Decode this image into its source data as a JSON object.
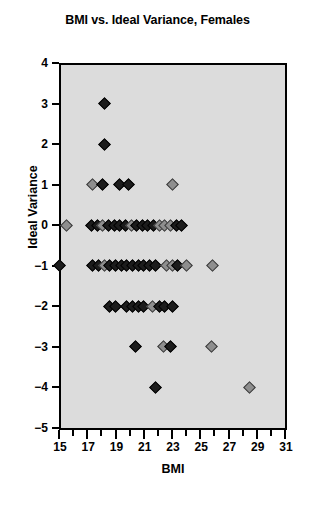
{
  "chart_data": {
    "type": "scatter",
    "title": "BMI vs. Ideal Variance, Females",
    "xlabel": "BMI",
    "ylabel": "Ideal Variance",
    "xlim": [
      15,
      31
    ],
    "ylim": [
      -5,
      4
    ],
    "xticks": [
      15,
      16,
      17,
      18,
      19,
      20,
      21,
      22,
      23,
      24,
      25,
      26,
      27,
      28,
      29,
      30,
      31
    ],
    "xtick_labels": [
      "15",
      "",
      "17",
      "",
      "19",
      "",
      "21",
      "",
      "23",
      "",
      "25",
      "",
      "27",
      "",
      "29",
      "",
      "31"
    ],
    "yticks": [
      4,
      3,
      2,
      1,
      0,
      -1,
      -2,
      -3,
      -4,
      -5
    ],
    "ytick_labels": [
      "4",
      "3",
      "2",
      "1",
      "0",
      "−1",
      "−2",
      "−3",
      "−4",
      "−5"
    ],
    "grid": false,
    "legend": false,
    "plot_bgcolor": "#dcdcdc",
    "marker_colors": {
      "dark": "#1c1c1c",
      "light": "#8e8e8e"
    },
    "points": [
      {
        "x": 18.25,
        "y": 3,
        "shade": "dark"
      },
      {
        "x": 18.25,
        "y": 2,
        "shade": "dark"
      },
      {
        "x": 17.4,
        "y": 1,
        "shade": "light"
      },
      {
        "x": 18.1,
        "y": 1,
        "shade": "dark"
      },
      {
        "x": 19.3,
        "y": 1,
        "shade": "dark"
      },
      {
        "x": 19.9,
        "y": 1,
        "shade": "dark"
      },
      {
        "x": 23.0,
        "y": 1,
        "shade": "light"
      },
      {
        "x": 15.5,
        "y": 0,
        "shade": "light"
      },
      {
        "x": 17.3,
        "y": 0,
        "shade": "dark"
      },
      {
        "x": 17.7,
        "y": 0,
        "shade": "dark"
      },
      {
        "x": 18.1,
        "y": 0,
        "shade": "light"
      },
      {
        "x": 18.5,
        "y": 0,
        "shade": "dark"
      },
      {
        "x": 18.9,
        "y": 0,
        "shade": "dark"
      },
      {
        "x": 19.3,
        "y": 0,
        "shade": "dark"
      },
      {
        "x": 19.7,
        "y": 0,
        "shade": "dark"
      },
      {
        "x": 20.1,
        "y": 0,
        "shade": "light"
      },
      {
        "x": 20.5,
        "y": 0,
        "shade": "dark"
      },
      {
        "x": 20.9,
        "y": 0,
        "shade": "dark"
      },
      {
        "x": 21.3,
        "y": 0,
        "shade": "dark"
      },
      {
        "x": 21.7,
        "y": 0,
        "shade": "dark"
      },
      {
        "x": 22.1,
        "y": 0,
        "shade": "light"
      },
      {
        "x": 22.5,
        "y": 0,
        "shade": "light"
      },
      {
        "x": 22.9,
        "y": 0,
        "shade": "light"
      },
      {
        "x": 23.3,
        "y": 0,
        "shade": "dark"
      },
      {
        "x": 23.7,
        "y": 0,
        "shade": "dark"
      },
      {
        "x": 15.0,
        "y": -1,
        "shade": "dark"
      },
      {
        "x": 17.4,
        "y": -1,
        "shade": "dark"
      },
      {
        "x": 17.8,
        "y": -1,
        "shade": "dark"
      },
      {
        "x": 18.2,
        "y": -1,
        "shade": "light"
      },
      {
        "x": 18.6,
        "y": -1,
        "shade": "dark"
      },
      {
        "x": 19.0,
        "y": -1,
        "shade": "dark"
      },
      {
        "x": 19.4,
        "y": -1,
        "shade": "dark"
      },
      {
        "x": 19.8,
        "y": -1,
        "shade": "dark"
      },
      {
        "x": 20.2,
        "y": -1,
        "shade": "dark"
      },
      {
        "x": 20.6,
        "y": -1,
        "shade": "dark"
      },
      {
        "x": 21.0,
        "y": -1,
        "shade": "dark"
      },
      {
        "x": 21.4,
        "y": -1,
        "shade": "dark"
      },
      {
        "x": 21.8,
        "y": -1,
        "shade": "dark"
      },
      {
        "x": 22.6,
        "y": -1,
        "shade": "light"
      },
      {
        "x": 23.0,
        "y": -1,
        "shade": "light"
      },
      {
        "x": 23.4,
        "y": -1,
        "shade": "dark"
      },
      {
        "x": 24.0,
        "y": -1,
        "shade": "light"
      },
      {
        "x": 25.9,
        "y": -1,
        "shade": "light"
      },
      {
        "x": 18.6,
        "y": -2,
        "shade": "dark"
      },
      {
        "x": 19.0,
        "y": -2,
        "shade": "dark"
      },
      {
        "x": 19.8,
        "y": -2,
        "shade": "dark"
      },
      {
        "x": 20.2,
        "y": -2,
        "shade": "dark"
      },
      {
        "x": 20.6,
        "y": -2,
        "shade": "dark"
      },
      {
        "x": 21.0,
        "y": -2,
        "shade": "dark"
      },
      {
        "x": 21.6,
        "y": -2,
        "shade": "light"
      },
      {
        "x": 22.1,
        "y": -2,
        "shade": "dark"
      },
      {
        "x": 22.5,
        "y": -2,
        "shade": "dark"
      },
      {
        "x": 23.0,
        "y": -2,
        "shade": "dark"
      },
      {
        "x": 20.4,
        "y": -3,
        "shade": "dark"
      },
      {
        "x": 22.4,
        "y": -3,
        "shade": "light"
      },
      {
        "x": 22.9,
        "y": -3,
        "shade": "dark"
      },
      {
        "x": 25.8,
        "y": -3,
        "shade": "light"
      },
      {
        "x": 21.8,
        "y": -4,
        "shade": "dark"
      },
      {
        "x": 28.5,
        "y": -4,
        "shade": "light"
      }
    ]
  }
}
